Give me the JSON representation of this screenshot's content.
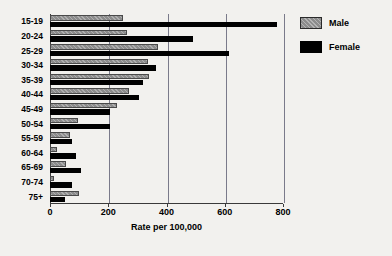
{
  "chart_data": {
    "type": "bar",
    "orientation": "horizontal",
    "title": "",
    "xlabel": "Rate per 100,000",
    "ylabel": "",
    "xlim": [
      0,
      800
    ],
    "xticks": [
      0,
      200,
      400,
      600,
      800
    ],
    "grid": true,
    "legend_position": "right",
    "categories": [
      "15-19",
      "20-24",
      "25-29",
      "30-34",
      "35-39",
      "40-44",
      "45-49",
      "50-54",
      "55-59",
      "60-64",
      "65-69",
      "70-74",
      "75+"
    ],
    "series": [
      {
        "name": "Male",
        "color": "#8c8c8c",
        "values": [
          250,
          265,
          370,
          335,
          340,
          270,
          230,
          95,
          70,
          25,
          55,
          15,
          100
        ]
      },
      {
        "name": "Female",
        "color": "#000000",
        "values": [
          780,
          490,
          615,
          365,
          320,
          305,
          205,
          205,
          75,
          90,
          105,
          75,
          50
        ]
      }
    ]
  },
  "legend": {
    "items": [
      {
        "label": "Male"
      },
      {
        "label": "Female"
      }
    ]
  },
  "axis": {
    "x_title": "Rate per 100,000",
    "tick_labels": [
      "0",
      "200",
      "400",
      "600",
      "800"
    ]
  }
}
